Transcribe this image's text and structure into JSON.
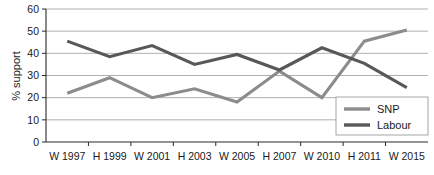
{
  "chart_data": {
    "type": "line",
    "title": "",
    "xlabel": "",
    "ylabel": "% support",
    "ylim": [
      0,
      60
    ],
    "ytick_step": 10,
    "yticks": [
      "0",
      "10",
      "20",
      "30",
      "40",
      "50",
      "60"
    ],
    "grid": true,
    "legend_position": "inside-bottom-right",
    "categories": [
      "W 1997",
      "H 1999",
      "W 2001",
      "H 2003",
      "W 2005",
      "H 2007",
      "W 2010",
      "H 2011",
      "W 2015"
    ],
    "series": [
      {
        "name": "SNP",
        "color": "#8c8c8c",
        "values": [
          22,
          29,
          20,
          24,
          18,
          32,
          20,
          45.5,
          50.5
        ]
      },
      {
        "name": "Labour",
        "color": "#585858",
        "values": [
          45.5,
          38.5,
          43.5,
          35,
          39.5,
          32.5,
          42.5,
          35.5,
          24.5
        ]
      }
    ]
  },
  "axes": {
    "y_axis_title": "% support"
  },
  "legend": {
    "entries": [
      {
        "label": "SNP"
      },
      {
        "label": "Labour"
      }
    ]
  },
  "colors": {
    "snp": "#8c8c8c",
    "labour": "#585858",
    "grid": "#9a9a9a",
    "axis": "#2b2b2b",
    "text": "#1a1a1a",
    "background": "#ffffff"
  }
}
